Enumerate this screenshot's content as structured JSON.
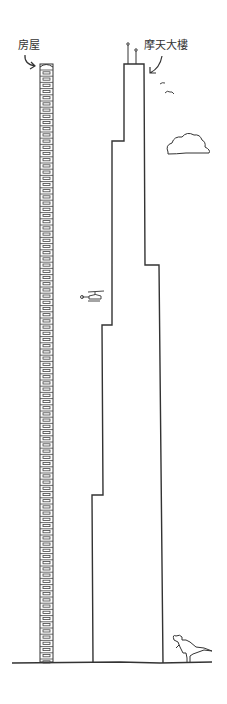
{
  "labels": {
    "house": "房屋",
    "skyscraper": "摩天大樓"
  },
  "figure": {
    "elements": [
      "house-stack",
      "skyscraper",
      "antennas",
      "birds",
      "cloud",
      "helicopter",
      "dinosaur",
      "ground-line"
    ],
    "colors": {
      "line": "#333333",
      "background": "#ffffff"
    }
  }
}
